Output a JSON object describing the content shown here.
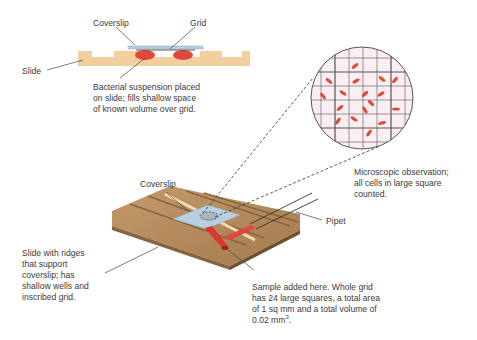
{
  "labels": {
    "coverslip_top": "Coverslip",
    "grid_top": "Grid",
    "slide_top": "Slide",
    "suspension": [
      "Bacterial suspension placed",
      "on slide; fills shallow space",
      "of known volume over grid."
    ],
    "microscopic": [
      "Microscopic observation;",
      "all cells in large square",
      "counted."
    ],
    "coverslip_3d": "Coverslip",
    "pipet": "Pipet",
    "slide_3d": [
      "Slide with ridges",
      "that support",
      "coverslip; has",
      "shallow wells and",
      "inscribed grid."
    ],
    "sample": [
      "Sample added here. Whole grid",
      "has 24 large squares, a total area",
      "of 1 sq mm and a total volume of"
    ],
    "sample_volume": "0.02 mm",
    "sample_volume_exp": "3",
    "sample_volume_end": "."
  },
  "colors": {
    "slide_tan": "#f2cf9c",
    "wood": "#b58a5c",
    "wood_dark": "#8a6440",
    "coverslip": "#b9cfe0",
    "cells": "#e0483c",
    "circle_bg": "#fbeef2",
    "text": "#3b3b3b"
  }
}
